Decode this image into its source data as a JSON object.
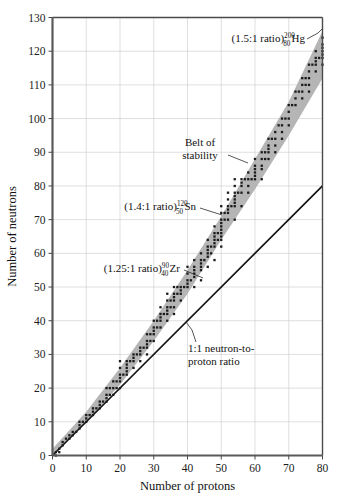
{
  "chart_data": {
    "type": "scatter",
    "title": "",
    "xlabel": "Number of protons",
    "ylabel": "Number of neutrons",
    "xlim": [
      0,
      80
    ],
    "ylim": [
      0,
      130
    ],
    "xticks": [
      0,
      10,
      20,
      30,
      40,
      50,
      60,
      70,
      80
    ],
    "yticks": [
      0,
      10,
      20,
      30,
      40,
      50,
      60,
      70,
      80,
      90,
      100,
      110,
      120,
      130
    ],
    "grid": true,
    "legend_position": "none",
    "series": [
      {
        "name": "Belt of stability",
        "type": "band",
        "description": "Shaded grey band of stable nuclides",
        "lower_edge": [
          [
            0,
            0
          ],
          [
            10,
            10
          ],
          [
            20,
            21
          ],
          [
            30,
            34
          ],
          [
            40,
            48
          ],
          [
            50,
            64
          ],
          [
            60,
            79
          ],
          [
            70,
            95
          ],
          [
            80,
            112
          ]
        ],
        "upper_edge": [
          [
            0,
            2
          ],
          [
            10,
            13
          ],
          [
            20,
            26
          ],
          [
            30,
            40
          ],
          [
            40,
            55
          ],
          [
            50,
            71
          ],
          [
            60,
            88
          ],
          [
            70,
            105
          ],
          [
            80,
            126
          ]
        ]
      },
      {
        "name": "1:1 neutron-to-proton ratio",
        "type": "line",
        "points": [
          [
            0,
            0
          ],
          [
            80,
            80
          ]
        ]
      },
      {
        "name": "stable nuclides",
        "type": "scatter",
        "points": [
          [
            1,
            0
          ],
          [
            1,
            1
          ],
          [
            2,
            1
          ],
          [
            2,
            2
          ],
          [
            3,
            3
          ],
          [
            3,
            4
          ],
          [
            4,
            5
          ],
          [
            5,
            5
          ],
          [
            5,
            6
          ],
          [
            6,
            6
          ],
          [
            6,
            7
          ],
          [
            7,
            7
          ],
          [
            8,
            8
          ],
          [
            8,
            9
          ],
          [
            8,
            10
          ],
          [
            9,
            10
          ],
          [
            10,
            10
          ],
          [
            10,
            11
          ],
          [
            10,
            12
          ],
          [
            11,
            12
          ],
          [
            12,
            12
          ],
          [
            12,
            13
          ],
          [
            12,
            14
          ],
          [
            13,
            14
          ],
          [
            14,
            14
          ],
          [
            14,
            15
          ],
          [
            14,
            16
          ],
          [
            15,
            16
          ],
          [
            16,
            16
          ],
          [
            16,
            17
          ],
          [
            16,
            18
          ],
          [
            16,
            20
          ],
          [
            17,
            18
          ],
          [
            17,
            20
          ],
          [
            18,
            18
          ],
          [
            18,
            20
          ],
          [
            18,
            22
          ],
          [
            19,
            20
          ],
          [
            19,
            22
          ],
          [
            20,
            20
          ],
          [
            20,
            22
          ],
          [
            20,
            23
          ],
          [
            20,
            24
          ],
          [
            20,
            26
          ],
          [
            20,
            28
          ],
          [
            21,
            24
          ],
          [
            22,
            24
          ],
          [
            22,
            25
          ],
          [
            22,
            26
          ],
          [
            22,
            27
          ],
          [
            22,
            28
          ],
          [
            23,
            28
          ],
          [
            24,
            26
          ],
          [
            24,
            28
          ],
          [
            24,
            29
          ],
          [
            24,
            30
          ],
          [
            25,
            30
          ],
          [
            26,
            28
          ],
          [
            26,
            30
          ],
          [
            26,
            31
          ],
          [
            26,
            32
          ],
          [
            27,
            32
          ],
          [
            28,
            30
          ],
          [
            28,
            32
          ],
          [
            28,
            33
          ],
          [
            28,
            34
          ],
          [
            28,
            36
          ],
          [
            29,
            34
          ],
          [
            29,
            36
          ],
          [
            30,
            34
          ],
          [
            30,
            36
          ],
          [
            30,
            37
          ],
          [
            30,
            38
          ],
          [
            30,
            40
          ],
          [
            31,
            38
          ],
          [
            31,
            40
          ],
          [
            32,
            38
          ],
          [
            32,
            40
          ],
          [
            32,
            41
          ],
          [
            32,
            42
          ],
          [
            32,
            44
          ],
          [
            33,
            42
          ],
          [
            34,
            40
          ],
          [
            34,
            42
          ],
          [
            34,
            43
          ],
          [
            34,
            44
          ],
          [
            34,
            46
          ],
          [
            34,
            48
          ],
          [
            35,
            44
          ],
          [
            35,
            46
          ],
          [
            36,
            42
          ],
          [
            36,
            44
          ],
          [
            36,
            46
          ],
          [
            36,
            47
          ],
          [
            36,
            48
          ],
          [
            36,
            50
          ],
          [
            37,
            48
          ],
          [
            37,
            50
          ],
          [
            38,
            46
          ],
          [
            38,
            48
          ],
          [
            38,
            49
          ],
          [
            38,
            50
          ],
          [
            39,
            50
          ],
          [
            40,
            50
          ],
          [
            40,
            51
          ],
          [
            40,
            52
          ],
          [
            40,
            54
          ],
          [
            40,
            56
          ],
          [
            41,
            52
          ],
          [
            42,
            50
          ],
          [
            42,
            53
          ],
          [
            42,
            54
          ],
          [
            42,
            55
          ],
          [
            42,
            56
          ],
          [
            42,
            58
          ],
          [
            44,
            52
          ],
          [
            44,
            55
          ],
          [
            44,
            56
          ],
          [
            44,
            57
          ],
          [
            44,
            58
          ],
          [
            44,
            60
          ],
          [
            45,
            58
          ],
          [
            46,
            56
          ],
          [
            46,
            59
          ],
          [
            46,
            60
          ],
          [
            46,
            61
          ],
          [
            46,
            62
          ],
          [
            46,
            64
          ],
          [
            47,
            60
          ],
          [
            47,
            62
          ],
          [
            48,
            58
          ],
          [
            48,
            62
          ],
          [
            48,
            63
          ],
          [
            48,
            64
          ],
          [
            48,
            65
          ],
          [
            48,
            66
          ],
          [
            48,
            68
          ],
          [
            49,
            64
          ],
          [
            49,
            66
          ],
          [
            50,
            62
          ],
          [
            50,
            64
          ],
          [
            50,
            65
          ],
          [
            50,
            66
          ],
          [
            50,
            67
          ],
          [
            50,
            68
          ],
          [
            50,
            69
          ],
          [
            50,
            70
          ],
          [
            50,
            72
          ],
          [
            50,
            74
          ],
          [
            51,
            70
          ],
          [
            51,
            72
          ],
          [
            52,
            70
          ],
          [
            52,
            72
          ],
          [
            52,
            73
          ],
          [
            52,
            74
          ],
          [
            52,
            76
          ],
          [
            52,
            78
          ],
          [
            53,
            74
          ],
          [
            54,
            70
          ],
          [
            54,
            74
          ],
          [
            54,
            75
          ],
          [
            54,
            76
          ],
          [
            54,
            77
          ],
          [
            54,
            78
          ],
          [
            54,
            80
          ],
          [
            54,
            82
          ],
          [
            55,
            78
          ],
          [
            56,
            74
          ],
          [
            56,
            78
          ],
          [
            56,
            80
          ],
          [
            56,
            81
          ],
          [
            56,
            82
          ],
          [
            57,
            82
          ],
          [
            58,
            78
          ],
          [
            58,
            80
          ],
          [
            58,
            82
          ],
          [
            58,
            84
          ],
          [
            59,
            82
          ],
          [
            60,
            82
          ],
          [
            60,
            83
          ],
          [
            60,
            84
          ],
          [
            60,
            85
          ],
          [
            60,
            86
          ],
          [
            60,
            88
          ],
          [
            62,
            82
          ],
          [
            62,
            85
          ],
          [
            62,
            86
          ],
          [
            62,
            88
          ],
          [
            62,
            90
          ],
          [
            63,
            88
          ],
          [
            63,
            90
          ],
          [
            64,
            88
          ],
          [
            64,
            90
          ],
          [
            64,
            91
          ],
          [
            64,
            92
          ],
          [
            64,
            94
          ],
          [
            65,
            94
          ],
          [
            66,
            90
          ],
          [
            66,
            92
          ],
          [
            66,
            94
          ],
          [
            66,
            96
          ],
          [
            67,
            98
          ],
          [
            68,
            94
          ],
          [
            68,
            96
          ],
          [
            68,
            98
          ],
          [
            68,
            100
          ],
          [
            69,
            100
          ],
          [
            70,
            98
          ],
          [
            70,
            100
          ],
          [
            70,
            102
          ],
          [
            70,
            104
          ],
          [
            71,
            104
          ],
          [
            72,
            104
          ],
          [
            72,
            106
          ],
          [
            72,
            108
          ],
          [
            73,
            108
          ],
          [
            74,
            106
          ],
          [
            74,
            108
          ],
          [
            74,
            110
          ],
          [
            74,
            112
          ],
          [
            75,
            110
          ],
          [
            75,
            112
          ],
          [
            76,
            108
          ],
          [
            76,
            110
          ],
          [
            76,
            112
          ],
          [
            76,
            114
          ],
          [
            76,
            116
          ],
          [
            77,
            116
          ],
          [
            78,
            114
          ],
          [
            78,
            116
          ],
          [
            78,
            117
          ],
          [
            78,
            118
          ],
          [
            78,
            120
          ],
          [
            79,
            118
          ],
          [
            80,
            116
          ],
          [
            80,
            118
          ],
          [
            80,
            119
          ],
          [
            80,
            120
          ],
          [
            80,
            121
          ],
          [
            80,
            122
          ],
          [
            80,
            124
          ]
        ]
      }
    ],
    "annotations": [
      {
        "name": "hg-label",
        "prefix": "(1.5:1 ratio)",
        "superscript": "200",
        "subscript": "80",
        "element": "Hg",
        "full_text": "(1.5:1 ratio) 200 80 Hg"
      },
      {
        "name": "belt-of-stability-label",
        "line1": "Belt of",
        "line2": "stability"
      },
      {
        "name": "sn-label",
        "prefix": "(1.4:1 ratio)",
        "superscript": "120",
        "subscript": "50",
        "element": "Sn",
        "full_text": "(1.4:1 ratio) 120 50 Sn"
      },
      {
        "name": "zr-label",
        "prefix": "(1.25:1 ratio)",
        "superscript": "90",
        "subscript": "40",
        "element": "Zr",
        "full_text": "(1.25:1 ratio) 90 40 Zr"
      },
      {
        "name": "one-to-one-label",
        "line1": "1:1 neutron-to-",
        "line2": "proton ratio"
      }
    ],
    "colors": {
      "belt_fill": "#b5b5b5",
      "grid": "#c9c9cf",
      "frame": "#4a4a4a",
      "point": "#1b1b1b",
      "line": "#141414",
      "background": "#ffffff"
    }
  }
}
